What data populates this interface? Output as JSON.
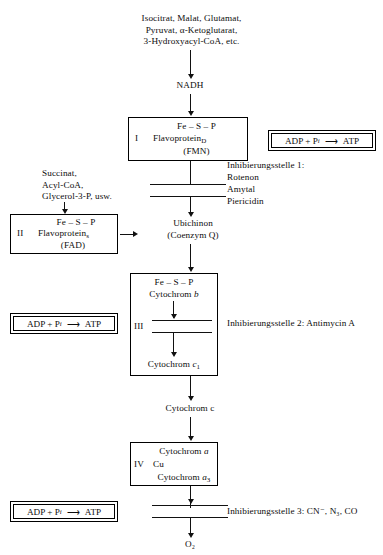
{
  "diagram": {
    "substrates_top": "Isocitrat, Malat, Glutamat,\nPyruvat, α-Ketoglutarat,\n3-Hydroxyacyl-CoA, etc.",
    "nadh_label": "NADH",
    "substrates_left": "Succinat,\nAcyl-CoA,\nGlycerol-3-P, usw.",
    "ubiquinone_line1": "Ubichinon",
    "ubiquinone_line2": "(Coenzym Q)",
    "cytochrome_c_label": "Cytochrom c",
    "oxygen_label": "O₂"
  },
  "complex_1": {
    "roman": "I",
    "line1": "Fe – S – P",
    "line2": "Flavoprotein",
    "line2_sub": "D",
    "line3": "(FMN)"
  },
  "complex_2": {
    "roman": "II",
    "line1": "Fe – S – P",
    "line2": "Flavoprotein",
    "line2_sub": "s",
    "line3": "(FAD)"
  },
  "complex_3": {
    "roman": "III",
    "line1": "Fe – S – P",
    "line2_prefix": "Cytochrom ",
    "line2_ital": "b",
    "line3_prefix": "Cytochrom ",
    "line3_ital": "c",
    "line3_sub": "1"
  },
  "complex_4": {
    "roman": "IV",
    "line1_prefix": "Cytochrom ",
    "line1_ital": "a",
    "line2": "Cu",
    "line3_prefix": "Cytochrom ",
    "line3_ital": "a",
    "line3_sub": "3"
  },
  "atp_boxes": [
    {
      "text": "ADP + P",
      "sub": "i",
      "arrow": "⟶",
      "product": "ATP"
    },
    {
      "text": "ADP + P",
      "sub": "i",
      "arrow": "⟶",
      "product": "ATP"
    },
    {
      "text": "ADP + P",
      "sub": "i",
      "arrow": "⟶",
      "product": "ATP"
    }
  ],
  "inhibition_sites": [
    {
      "heading": "Inhibierungsstelle 1:",
      "items": [
        "Rotenon",
        "Amytal",
        "Piericidin"
      ]
    },
    {
      "heading": "Inhibierungsstelle 2: Antimycin A",
      "items": []
    },
    {
      "heading": "Inhibierungsstelle 3: CN⁻, N₃, CO",
      "items": []
    }
  ],
  "colors": {
    "ink": "#0d0d0d",
    "rule": "#111111",
    "background": "#ffffff"
  }
}
